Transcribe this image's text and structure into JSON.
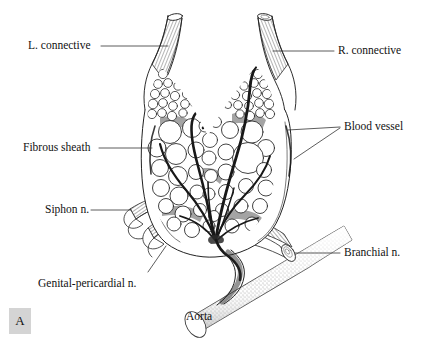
{
  "figure": {
    "panel_letter": "A",
    "background_color": "#ffffff",
    "ink_color": "#111111",
    "panel_box_color": "#d4d4d4"
  },
  "labels": [
    {
      "id": "l-connective",
      "text": "L. connective",
      "side": "left",
      "x": 28,
      "y": 45,
      "leader_to_x": 168,
      "leader_to_y": 46
    },
    {
      "id": "r-connective",
      "text": "R. connective",
      "side": "right",
      "x": 338,
      "y": 53,
      "leader_to_x": 273,
      "leader_to_y": 50
    },
    {
      "id": "blood-vessel",
      "text": "Blood vessel",
      "side": "right",
      "x": 344,
      "y": 128,
      "leader_to_x": 288,
      "leader_to_y": 130
    },
    {
      "id": "fibrous-sheath",
      "text": "Fibrous sheath",
      "side": "left",
      "x": 23,
      "y": 148,
      "leader_to_x": 152,
      "leader_to_y": 148
    },
    {
      "id": "siphon-n",
      "text": "Siphon n.",
      "side": "left",
      "x": 45,
      "y": 211,
      "leader_to_x": 131,
      "leader_to_y": 210
    },
    {
      "id": "genital-pericardial-n",
      "text": "Genital-pericardial n.",
      "side": "left",
      "x": 38,
      "y": 284,
      "leader_to_x": 163,
      "leader_to_y": 249
    },
    {
      "id": "branchial-n",
      "text": "Branchial n.",
      "side": "right",
      "x": 344,
      "y": 254,
      "leader_to_x": 290,
      "leader_to_y": 253
    },
    {
      "id": "aorta",
      "text": "Aorta",
      "side": "center",
      "x": 186,
      "y": 318,
      "leader_to_x": null,
      "leader_to_y": null
    }
  ],
  "structures": {
    "left_connective": "hatched tube rising to upper-left from ganglion",
    "right_connective": "hatched tube rising to upper-right from ganglion",
    "ganglion_body": "V-shaped sac packed with round neuron cell bodies",
    "fibrous_sheath": "outer capsule outline enclosing the ganglion",
    "blood_vessels": "dark branching vessels entering and ramifying in the ganglion",
    "siphon_nerve": "hatched tube leaving lower-left",
    "genital_pericardial_nerve": "small hatched tube below the siphon nerve",
    "branchial_nerve": "hatched tube leaving lower-right with cut end",
    "aorta": "stippled tube running diagonally beneath the ganglion"
  }
}
